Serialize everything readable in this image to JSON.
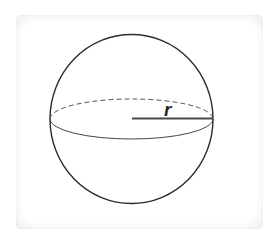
{
  "diagram": {
    "labels": {
      "radius": "r"
    },
    "colors": {
      "stroke": "#2b2b2b",
      "radius_line": "#4a4a4a",
      "card_bg": "#f2f2f2"
    }
  }
}
